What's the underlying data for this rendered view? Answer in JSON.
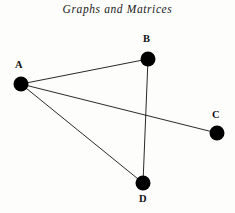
{
  "figure": {
    "title": "Graphs and Matrices",
    "background_color": "#fdfdfc",
    "ink_color": "#000000",
    "width": 235,
    "height": 213
  },
  "chart_data": {
    "type": "diagram",
    "subtype": "undirected-graph",
    "title": "Graphs and Matrices",
    "xlabel": "",
    "ylabel": "",
    "grid": false,
    "legend": null,
    "node_radius": 7.5,
    "edge_width": 0.9,
    "node_color": "#000000",
    "edge_color": "#111111",
    "nodes": [
      {
        "id": "A",
        "label": "A",
        "x": 21,
        "y": 84,
        "label_x": 15,
        "label_y": 60,
        "degree": 3
      },
      {
        "id": "B",
        "label": "B",
        "x": 148,
        "y": 59,
        "label_x": 143,
        "label_y": 34,
        "degree": 2
      },
      {
        "id": "C",
        "label": "C",
        "x": 217,
        "y": 133,
        "label_x": 212,
        "label_y": 110,
        "degree": 1
      },
      {
        "id": "D",
        "label": "D",
        "x": 143,
        "y": 183,
        "label_x": 139,
        "label_y": 194,
        "degree": 2
      }
    ],
    "edges": [
      {
        "from": "A",
        "to": "B"
      },
      {
        "from": "A",
        "to": "C"
      },
      {
        "from": "A",
        "to": "D"
      },
      {
        "from": "B",
        "to": "D"
      }
    ],
    "edge_crossings": [
      {
        "edge_a": "A-C",
        "edge_b": "B-D",
        "x": 145,
        "y": 112
      }
    ]
  }
}
